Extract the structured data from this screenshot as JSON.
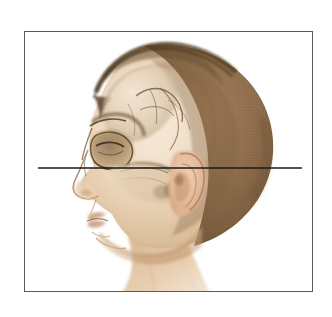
{
  "figure": {
    "type": "anatomical-illustration",
    "caption": "",
    "frame": {
      "present": true,
      "stroke_color": "#5a5a5a",
      "stroke_width_px": 1,
      "x": 24,
      "y": 31,
      "width": 289,
      "height": 261,
      "fill": "#ffffff"
    },
    "background_color": "#ffffff",
    "reference_line": {
      "label": "",
      "orientation": "horizontal",
      "color": "#1a1a1a",
      "thickness_px": 1.5,
      "x_start": 38,
      "x_end": 302,
      "y": 168,
      "passes_through": "external auditory meatus and infraorbital rim"
    },
    "palette": {
      "cranium_brown": "#8a6a4a",
      "cranium_brown_dark": "#6d5238",
      "hairline_edge": "#4a3624",
      "skin_light": "#f0dcc8",
      "skin_mid": "#ddbf9e",
      "skin_shadow": "#b98f66",
      "bone_light": "#efe4d4",
      "bone_mid": "#d7c4aa",
      "bone_shadow": "#a68a6b",
      "outline": "#6b5235",
      "ear_pink": "#e0b394",
      "lip": "#c99a78"
    },
    "anatomy_labels": [
      "cranium",
      "frontal bone",
      "orbit",
      "nasal bone",
      "zygomatic arch",
      "maxilla",
      "mandible",
      "external ear (auricle)",
      "external auditory meatus",
      "neck"
    ]
  }
}
